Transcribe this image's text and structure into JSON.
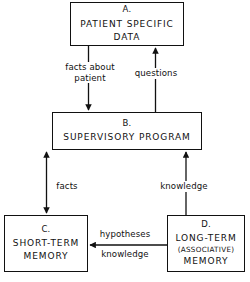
{
  "diagram": {
    "stroke_color": "#111111",
    "background_color": "#ffffff",
    "nodes": [
      {
        "id": "A",
        "letter": "A.",
        "lines": [
          "PATIENT SPECIFIC",
          "DATA"
        ],
        "line1": "PATIENT SPECIFIC",
        "line2": "DATA"
      },
      {
        "id": "B",
        "letter": "B.",
        "lines": [
          "SUPERVISORY  PROGRAM"
        ],
        "line1": "SUPERVISORY  PROGRAM"
      },
      {
        "id": "C",
        "letter": "C.",
        "lines": [
          "SHORT-TERM",
          "MEMORY"
        ],
        "line1": "SHORT-TERM",
        "line2": "MEMORY"
      },
      {
        "id": "D",
        "letter": "D.",
        "lines": [
          "LONG-TERM",
          "(ASSOCIATIVE)",
          "MEMORY"
        ],
        "line1": "LONG-TERM",
        "line2": "(ASSOCIATIVE)",
        "line3": "MEMORY"
      }
    ],
    "edges": [
      {
        "id": "a-to-b",
        "from": "A",
        "to": "B",
        "direction": "down",
        "label_line1": "facts about",
        "label_line2": "patient"
      },
      {
        "id": "b-to-a",
        "from": "B",
        "to": "A",
        "direction": "up",
        "label_line1": "questions"
      },
      {
        "id": "b-c",
        "from": "B",
        "to": "C",
        "direction": "both",
        "label_line1": "facts"
      },
      {
        "id": "d-to-b",
        "from": "D",
        "to": "B",
        "direction": "up",
        "label_line1": "knowledge"
      },
      {
        "id": "d-to-c",
        "from": "D",
        "to": "C",
        "direction": "left",
        "label_line1": "hypotheses",
        "label_line2": "knowledge"
      }
    ]
  }
}
